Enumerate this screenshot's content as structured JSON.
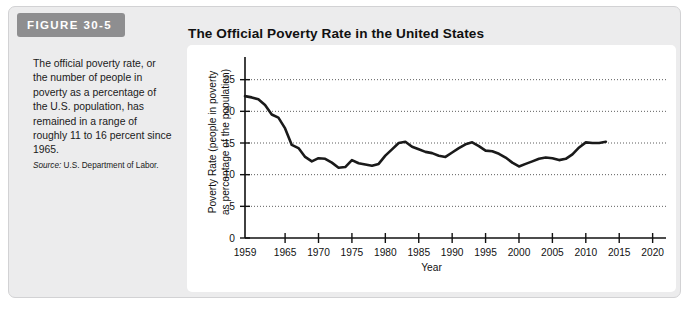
{
  "figure": {
    "badge_label": "FIGURE 30-5",
    "caption": "The official poverty rate, or the number of people in poverty as a percentage of the U.S. population, has remained in a range of roughly 11 to 16 percent since 1965.",
    "source_label": "Source:",
    "source_text": " U.S. Department of Labor.",
    "badge_color": "#8e8e90",
    "panel_color": "#ececed",
    "card_color": "#ffffff",
    "line_color": "#1a1a1a"
  },
  "chart_data": {
    "type": "line",
    "title": "The Official Poverty Rate in the United States",
    "xlabel": "Year",
    "ylabel": "Poverty Rate (people in poverty as percentage of the population)",
    "ylabel_line1": "Poverty Rate (people in poverty",
    "ylabel_line2": "as percentage of the population)",
    "xlim": [
      1959,
      2022
    ],
    "ylim": [
      0,
      27
    ],
    "xticks": [
      1959,
      1965,
      1970,
      1975,
      1980,
      1985,
      1990,
      1995,
      2000,
      2005,
      2010,
      2015,
      2020
    ],
    "xtick_labels": [
      "1959",
      "1965",
      "1970",
      "1975",
      "1980",
      "1985",
      "1990",
      "1995",
      "2000",
      "2005",
      "2010",
      "2015",
      "2020"
    ],
    "yticks": [
      0,
      5,
      10,
      15,
      20,
      25
    ],
    "ytick_labels": [
      "0",
      "5",
      "10",
      "15",
      "20",
      "25"
    ],
    "grid": "horizontal-dotted",
    "legend": "none",
    "series": [
      {
        "name": "Poverty rate",
        "color": "#1a1a1a",
        "x": [
          1959,
          1960,
          1961,
          1962,
          1963,
          1964,
          1965,
          1966,
          1967,
          1968,
          1969,
          1970,
          1971,
          1972,
          1973,
          1974,
          1975,
          1976,
          1977,
          1978,
          1979,
          1980,
          1981,
          1982,
          1983,
          1984,
          1985,
          1986,
          1987,
          1988,
          1989,
          1990,
          1991,
          1992,
          1993,
          1994,
          1995,
          1996,
          1997,
          1998,
          1999,
          2000,
          2001,
          2002,
          2003,
          2004,
          2005,
          2006,
          2007,
          2008,
          2009,
          2010,
          2011,
          2012,
          2013
        ],
        "values": [
          22.4,
          22.2,
          21.9,
          21.0,
          19.5,
          19.0,
          17.3,
          14.7,
          14.2,
          12.8,
          12.1,
          12.6,
          12.5,
          11.9,
          11.1,
          11.2,
          12.3,
          11.8,
          11.6,
          11.4,
          11.7,
          13.0,
          14.0,
          15.0,
          15.2,
          14.4,
          14.0,
          13.6,
          13.4,
          13.0,
          12.8,
          13.5,
          14.2,
          14.8,
          15.1,
          14.5,
          13.8,
          13.7,
          13.3,
          12.7,
          11.9,
          11.3,
          11.7,
          12.1,
          12.5,
          12.7,
          12.6,
          12.3,
          12.5,
          13.2,
          14.3,
          15.1,
          15.0,
          15.0,
          15.2
        ]
      }
    ]
  }
}
